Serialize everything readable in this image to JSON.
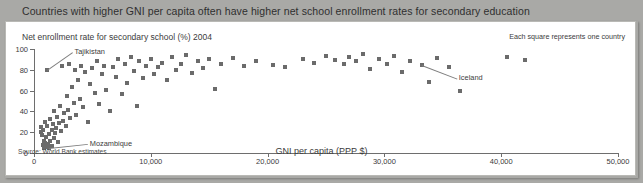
{
  "header": {
    "title": "Countries with higher GNI per capita often have higher net school enrollment rates for secondary education"
  },
  "colors": {
    "header_band": "#a9a9a6",
    "panel_background": "#ffffff",
    "marker": "#6b6b6b",
    "axis": "#6e6e6e",
    "text": "#3b3b3b"
  },
  "notes": {
    "each_square": "Each square represents one country",
    "source": "Source: World Bank estimates"
  },
  "chart_data": {
    "type": "scatter",
    "title": "Countries with higher GNI per capita often have higher net school enrollment rates for secondary education",
    "subtitle": "",
    "xlabel": "GNI per capita (PPP $)",
    "ylabel": "Net enrollment rate for secondary school (%) 2004",
    "xlim": [
      0,
      50000
    ],
    "ylim": [
      0,
      100
    ],
    "xticks": [
      0,
      10000,
      20000,
      30000,
      40000,
      50000
    ],
    "xticklabels": [
      "0",
      "10,000",
      "20,000",
      "30,000",
      "40,000",
      "50,000"
    ],
    "yticks": [
      0,
      20,
      40,
      60,
      80,
      100
    ],
    "yticklabels": [
      "0",
      "20",
      "40",
      "60",
      "80",
      "100"
    ],
    "grid": false,
    "legend": null,
    "marker_note": "Each square represents one country",
    "source": "Source: World Bank estimates",
    "annotations": [
      {
        "label": "Tajikistan",
        "x": 1150,
        "y": 80,
        "label_x": 3300,
        "label_y": 97
      },
      {
        "label": "Mozambique",
        "x": 1250,
        "y": 5,
        "label_x": 4600,
        "label_y": 9
      },
      {
        "label": "Iceland",
        "x": 33200,
        "y": 85,
        "label_x": 36200,
        "label_y": 72
      }
    ],
    "points": [
      {
        "x": 600,
        "y": 20
      },
      {
        "x": 620,
        "y": 25
      },
      {
        "x": 700,
        "y": 17
      },
      {
        "x": 760,
        "y": 22
      },
      {
        "x": 800,
        "y": 8
      },
      {
        "x": 840,
        "y": 12
      },
      {
        "x": 880,
        "y": 5
      },
      {
        "x": 900,
        "y": 30
      },
      {
        "x": 950,
        "y": 10
      },
      {
        "x": 1000,
        "y": 15
      },
      {
        "x": 1050,
        "y": 6
      },
      {
        "x": 1100,
        "y": 26
      },
      {
        "x": 1150,
        "y": 80
      },
      {
        "x": 1200,
        "y": 9
      },
      {
        "x": 1250,
        "y": 5
      },
      {
        "x": 1300,
        "y": 18
      },
      {
        "x": 1350,
        "y": 33
      },
      {
        "x": 1400,
        "y": 12
      },
      {
        "x": 1500,
        "y": 22
      },
      {
        "x": 1550,
        "y": 7
      },
      {
        "x": 1600,
        "y": 28
      },
      {
        "x": 1700,
        "y": 14
      },
      {
        "x": 1750,
        "y": 40
      },
      {
        "x": 1800,
        "y": 19
      },
      {
        "x": 1900,
        "y": 24
      },
      {
        "x": 2000,
        "y": 35
      },
      {
        "x": 2050,
        "y": 11
      },
      {
        "x": 2150,
        "y": 29
      },
      {
        "x": 2250,
        "y": 45
      },
      {
        "x": 2300,
        "y": 21
      },
      {
        "x": 2400,
        "y": 84
      },
      {
        "x": 2500,
        "y": 31
      },
      {
        "x": 2600,
        "y": 38
      },
      {
        "x": 2700,
        "y": 26
      },
      {
        "x": 2800,
        "y": 55
      },
      {
        "x": 2900,
        "y": 41
      },
      {
        "x": 3000,
        "y": 86
      },
      {
        "x": 3100,
        "y": 34
      },
      {
        "x": 3250,
        "y": 63
      },
      {
        "x": 3400,
        "y": 48
      },
      {
        "x": 3500,
        "y": 80
      },
      {
        "x": 3600,
        "y": 37
      },
      {
        "x": 3800,
        "y": 70
      },
      {
        "x": 3900,
        "y": 52
      },
      {
        "x": 4000,
        "y": 84
      },
      {
        "x": 4200,
        "y": 44
      },
      {
        "x": 4400,
        "y": 78
      },
      {
        "x": 4600,
        "y": 30
      },
      {
        "x": 4800,
        "y": 66
      },
      {
        "x": 5000,
        "y": 82
      },
      {
        "x": 5200,
        "y": 58
      },
      {
        "x": 5400,
        "y": 88
      },
      {
        "x": 5600,
        "y": 47
      },
      {
        "x": 5800,
        "y": 76
      },
      {
        "x": 6000,
        "y": 84
      },
      {
        "x": 6200,
        "y": 61
      },
      {
        "x": 6500,
        "y": 40
      },
      {
        "x": 6800,
        "y": 83
      },
      {
        "x": 7000,
        "y": 73
      },
      {
        "x": 7200,
        "y": 90
      },
      {
        "x": 7500,
        "y": 57
      },
      {
        "x": 7800,
        "y": 86
      },
      {
        "x": 8000,
        "y": 67
      },
      {
        "x": 8300,
        "y": 92
      },
      {
        "x": 8600,
        "y": 79
      },
      {
        "x": 8800,
        "y": 45
      },
      {
        "x": 9000,
        "y": 88
      },
      {
        "x": 9300,
        "y": 72
      },
      {
        "x": 9600,
        "y": 84
      },
      {
        "x": 10000,
        "y": 90
      },
      {
        "x": 10300,
        "y": 76
      },
      {
        "x": 10600,
        "y": 83
      },
      {
        "x": 11000,
        "y": 87
      },
      {
        "x": 11400,
        "y": 70
      },
      {
        "x": 11800,
        "y": 92
      },
      {
        "x": 12200,
        "y": 80
      },
      {
        "x": 12600,
        "y": 86
      },
      {
        "x": 13000,
        "y": 94
      },
      {
        "x": 13500,
        "y": 77
      },
      {
        "x": 14000,
        "y": 88
      },
      {
        "x": 14500,
        "y": 82
      },
      {
        "x": 15000,
        "y": 90
      },
      {
        "x": 15500,
        "y": 62
      },
      {
        "x": 16000,
        "y": 86
      },
      {
        "x": 17000,
        "y": 91
      },
      {
        "x": 18000,
        "y": 84
      },
      {
        "x": 19000,
        "y": 88
      },
      {
        "x": 20500,
        "y": 85
      },
      {
        "x": 21500,
        "y": 83
      },
      {
        "x": 23000,
        "y": 90
      },
      {
        "x": 24000,
        "y": 87
      },
      {
        "x": 25000,
        "y": 93
      },
      {
        "x": 25800,
        "y": 89
      },
      {
        "x": 26500,
        "y": 86
      },
      {
        "x": 27000,
        "y": 92
      },
      {
        "x": 27600,
        "y": 88
      },
      {
        "x": 28200,
        "y": 95
      },
      {
        "x": 28800,
        "y": 81
      },
      {
        "x": 29500,
        "y": 90
      },
      {
        "x": 30200,
        "y": 86
      },
      {
        "x": 30800,
        "y": 93
      },
      {
        "x": 31500,
        "y": 78
      },
      {
        "x": 32200,
        "y": 88
      },
      {
        "x": 33200,
        "y": 85
      },
      {
        "x": 33800,
        "y": 68
      },
      {
        "x": 34500,
        "y": 91
      },
      {
        "x": 35500,
        "y": 83
      },
      {
        "x": 36500,
        "y": 60
      },
      {
        "x": 40500,
        "y": 92
      },
      {
        "x": 42000,
        "y": 89
      }
    ]
  }
}
